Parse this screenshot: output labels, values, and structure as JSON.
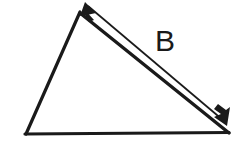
{
  "figure": {
    "kind": "geometry-diagram",
    "background_color": "#ffffff",
    "stroke_color": "#1a1a1a",
    "width": 241,
    "height": 142,
    "triangle": {
      "name": "triangle",
      "stroke_width": 3,
      "vertices": {
        "apex": {
          "x": 80,
          "y": 12
        },
        "bottom_left": {
          "x": 26,
          "y": 134
        },
        "bottom_right": {
          "x": 229,
          "y": 133
        }
      },
      "edges": [
        {
          "name": "left-edge",
          "from": "apex",
          "to": "bottom_left"
        },
        {
          "name": "bottom-edge",
          "from": "bottom_left",
          "to": "bottom_right"
        },
        {
          "name": "hypotenuse-edge",
          "from": "apex",
          "to": "bottom_right"
        }
      ]
    },
    "vector_arrow": {
      "name": "vector-b",
      "label": "B",
      "label_x": 165,
      "label_y": 51,
      "stroke_width": 1.6,
      "double_headed": true,
      "start": {
        "x": 86,
        "y": 3
      },
      "end": {
        "x": 226,
        "y": 124
      },
      "arrowhead_length": 17,
      "arrowhead_half_width": 6
    }
  }
}
